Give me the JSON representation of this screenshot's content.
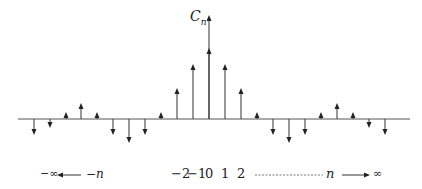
{
  "diagram": {
    "y_label": "C",
    "y_label_sub": "n",
    "axis_color": "#555555",
    "stem_color": "#333333",
    "bottom": {
      "left_inf": "−∞",
      "left_n": "−n",
      "ticks": [
        "−2",
        "−1",
        "0",
        "1",
        "2"
      ],
      "right_n": "n",
      "right_inf": "∞"
    },
    "stems": [
      {
        "x": 34,
        "y": 133
      },
      {
        "x": 50,
        "y": 126
      },
      {
        "x": 66,
        "y": 114
      },
      {
        "x": 81,
        "y": 105
      },
      {
        "x": 97,
        "y": 114
      },
      {
        "x": 113,
        "y": 133
      },
      {
        "x": 129,
        "y": 141
      },
      {
        "x": 145,
        "y": 133
      },
      {
        "x": 161,
        "y": 114
      },
      {
        "x": 177,
        "y": 90
      },
      {
        "x": 193,
        "y": 66
      },
      {
        "x": 209,
        "y": 50
      },
      {
        "x": 225,
        "y": 66
      },
      {
        "x": 241,
        "y": 90
      },
      {
        "x": 257,
        "y": 114
      },
      {
        "x": 273,
        "y": 133
      },
      {
        "x": 289,
        "y": 141
      },
      {
        "x": 305,
        "y": 133
      },
      {
        "x": 321,
        "y": 114
      },
      {
        "x": 337,
        "y": 105
      },
      {
        "x": 353,
        "y": 114
      },
      {
        "x": 369,
        "y": 126
      },
      {
        "x": 385,
        "y": 133
      }
    ]
  }
}
